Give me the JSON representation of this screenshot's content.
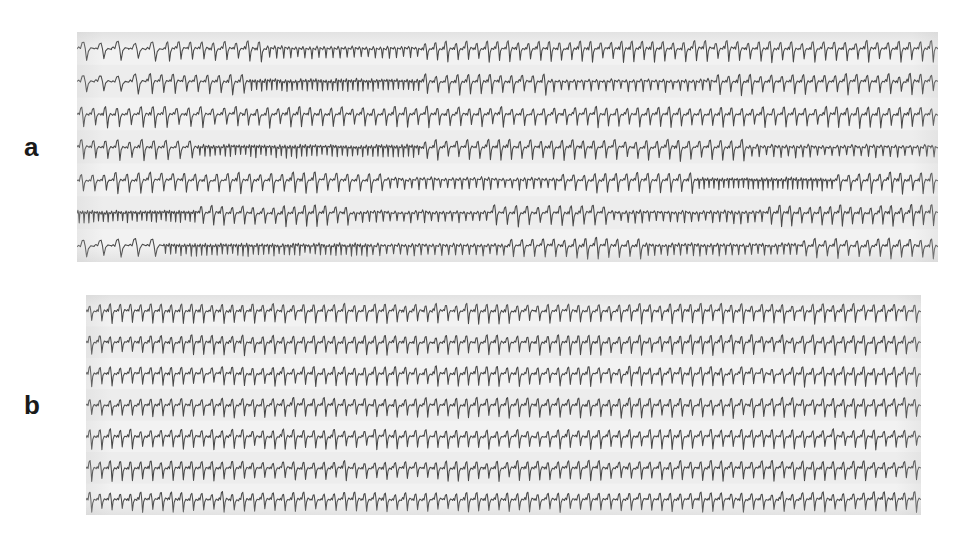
{
  "figure": {
    "type": "ecg-rhythm-strip-figure",
    "background_color": "#ffffff",
    "width": 956,
    "height": 539,
    "panels": [
      {
        "id": "a",
        "label": "a",
        "label_position": {
          "x": 24,
          "y": 134
        },
        "rect": {
          "x": 77,
          "y": 32,
          "width": 861,
          "height": 230
        },
        "paper_color": "#efefef",
        "trace_color": "#3a3a3a",
        "rows": 7,
        "rhythm": "irregular",
        "description": "Compressed full-disclosure Holter ECG showing highly variable ventricular rate with intermittent bursts of rapid tachycardia"
      },
      {
        "id": "b",
        "label": "b",
        "label_position": {
          "x": 24,
          "y": 392
        },
        "rect": {
          "x": 86,
          "y": 295,
          "width": 835,
          "height": 220
        },
        "paper_color": "#efefef",
        "trace_color": "#3a3a3a",
        "rows": 7,
        "rhythm": "regular",
        "description": "Compressed full-disclosure Holter ECG showing uniform regular rate throughout the recording"
      }
    ]
  },
  "chart_data": {
    "type": "line",
    "title": "",
    "subtitle": "",
    "xlabel": "",
    "ylabel": "",
    "grid": false,
    "legend": "none",
    "annotations": [
      "a",
      "b"
    ],
    "panels": [
      {
        "name": "a",
        "label": "a",
        "rhythm": "irregular",
        "rows": 7,
        "row_count": 7,
        "beats_per_row_range": [
          40,
          120
        ],
        "segments": [
          {
            "row": 0,
            "segments": [
              {
                "start": 0.0,
                "end": 0.1,
                "rate": "slow",
                "beats": 5
              },
              {
                "start": 0.1,
                "end": 0.22,
                "rate": "medium",
                "beats": 9
              },
              {
                "start": 0.22,
                "end": 0.4,
                "rate": "fast",
                "beats": 22
              },
              {
                "start": 0.4,
                "end": 0.52,
                "rate": "medium",
                "beats": 10
              },
              {
                "start": 0.52,
                "end": 0.7,
                "rate": "medium",
                "beats": 15
              },
              {
                "start": 0.7,
                "end": 1.0,
                "rate": "medium",
                "beats": 24
              }
            ]
          },
          {
            "row": 1,
            "segments": [
              {
                "start": 0.0,
                "end": 0.08,
                "rate": "slow",
                "beats": 4
              },
              {
                "start": 0.08,
                "end": 0.2,
                "rate": "medium",
                "beats": 9
              },
              {
                "start": 0.2,
                "end": 0.4,
                "rate": "veryfast",
                "beats": 34
              },
              {
                "start": 0.4,
                "end": 0.55,
                "rate": "medium",
                "beats": 12
              },
              {
                "start": 0.55,
                "end": 0.74,
                "rate": "fast",
                "beats": 22
              },
              {
                "start": 0.74,
                "end": 1.0,
                "rate": "medium",
                "beats": 21
              }
            ]
          },
          {
            "row": 2,
            "segments": [
              {
                "start": 0.0,
                "end": 0.18,
                "rate": "medium",
                "beats": 13
              },
              {
                "start": 0.18,
                "end": 0.34,
                "rate": "medium",
                "beats": 13
              },
              {
                "start": 0.34,
                "end": 0.55,
                "rate": "medium",
                "beats": 17
              },
              {
                "start": 0.55,
                "end": 0.78,
                "rate": "medium",
                "beats": 19
              },
              {
                "start": 0.78,
                "end": 1.0,
                "rate": "medium",
                "beats": 18
              }
            ]
          },
          {
            "row": 3,
            "segments": [
              {
                "start": 0.0,
                "end": 0.14,
                "rate": "medium",
                "beats": 10
              },
              {
                "start": 0.14,
                "end": 0.4,
                "rate": "veryfast",
                "beats": 44
              },
              {
                "start": 0.4,
                "end": 0.62,
                "rate": "medium",
                "beats": 18
              },
              {
                "start": 0.62,
                "end": 0.78,
                "rate": "medium",
                "beats": 13
              },
              {
                "start": 0.78,
                "end": 1.0,
                "rate": "fast",
                "beats": 26
              }
            ]
          },
          {
            "row": 4,
            "segments": [
              {
                "start": 0.0,
                "end": 0.12,
                "rate": "medium",
                "beats": 9
              },
              {
                "start": 0.12,
                "end": 0.36,
                "rate": "medium",
                "beats": 19
              },
              {
                "start": 0.36,
                "end": 0.56,
                "rate": "fast",
                "beats": 24
              },
              {
                "start": 0.56,
                "end": 0.72,
                "rate": "medium",
                "beats": 13
              },
              {
                "start": 0.72,
                "end": 0.88,
                "rate": "veryfast",
                "beats": 28
              },
              {
                "start": 0.88,
                "end": 1.0,
                "rate": "medium",
                "beats": 10
              }
            ]
          },
          {
            "row": 5,
            "segments": [
              {
                "start": 0.0,
                "end": 0.14,
                "rate": "veryfast",
                "beats": 25
              },
              {
                "start": 0.14,
                "end": 0.32,
                "rate": "medium",
                "beats": 15
              },
              {
                "start": 0.32,
                "end": 0.48,
                "rate": "fast",
                "beats": 20
              },
              {
                "start": 0.48,
                "end": 0.62,
                "rate": "medium",
                "beats": 11
              },
              {
                "start": 0.62,
                "end": 0.8,
                "rate": "fast",
                "beats": 22
              },
              {
                "start": 0.8,
                "end": 1.0,
                "rate": "medium",
                "beats": 17
              }
            ]
          },
          {
            "row": 6,
            "segments": [
              {
                "start": 0.0,
                "end": 0.1,
                "rate": "slow",
                "beats": 5
              },
              {
                "start": 0.1,
                "end": 0.34,
                "rate": "veryfast",
                "beats": 40
              },
              {
                "start": 0.34,
                "end": 0.5,
                "rate": "fast",
                "beats": 20
              },
              {
                "start": 0.5,
                "end": 0.66,
                "rate": "medium",
                "beats": 13
              },
              {
                "start": 0.66,
                "end": 0.84,
                "rate": "fast",
                "beats": 24
              },
              {
                "start": 0.84,
                "end": 1.0,
                "rate": "medium",
                "beats": 13
              }
            ]
          }
        ]
      },
      {
        "name": "b",
        "label": "b",
        "rhythm": "regular",
        "rows": 7,
        "row_count": 7,
        "beats_per_row_range": [
          82,
          82
        ],
        "segments": [
          {
            "row": 0,
            "segments": [
              {
                "start": 0.0,
                "end": 1.0,
                "rate": "uniform",
                "beats": 82
              }
            ]
          },
          {
            "row": 1,
            "segments": [
              {
                "start": 0.0,
                "end": 1.0,
                "rate": "uniform",
                "beats": 82
              }
            ]
          },
          {
            "row": 2,
            "segments": [
              {
                "start": 0.0,
                "end": 1.0,
                "rate": "uniform",
                "beats": 82
              }
            ]
          },
          {
            "row": 3,
            "segments": [
              {
                "start": 0.0,
                "end": 1.0,
                "rate": "uniform",
                "beats": 82
              }
            ]
          },
          {
            "row": 4,
            "segments": [
              {
                "start": 0.0,
                "end": 1.0,
                "rate": "uniform",
                "beats": 82
              }
            ]
          },
          {
            "row": 5,
            "segments": [
              {
                "start": 0.0,
                "end": 1.0,
                "rate": "uniform",
                "beats": 82
              }
            ]
          },
          {
            "row": 6,
            "segments": [
              {
                "start": 0.0,
                "end": 1.0,
                "rate": "uniform",
                "beats": 82
              }
            ]
          }
        ]
      }
    ]
  },
  "colors": {
    "page_background": "#ffffff",
    "strip_paper": "#efefef",
    "trace": "#3a3a3a",
    "label_text": "#1a1a1a"
  }
}
